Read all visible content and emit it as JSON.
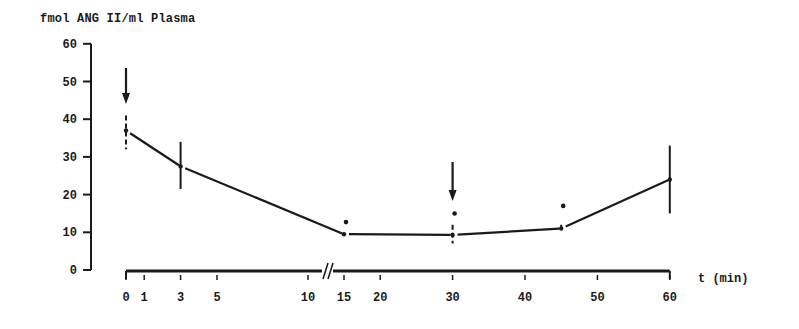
{
  "chart_data": {
    "type": "line",
    "title": "",
    "ylabel": "fmol ANG II/ml Plasma",
    "xlabel": "t (min)",
    "ylim": [
      0,
      60
    ],
    "yticks": [
      0,
      10,
      20,
      30,
      40,
      50,
      60
    ],
    "xticks": [
      0,
      1,
      3,
      5,
      10,
      15,
      20,
      30,
      40,
      50,
      60
    ],
    "xaxis_break": "between 10 and 15 min",
    "grid": false,
    "legend": null,
    "series": [
      {
        "name": "ANG II",
        "x": [
          0,
          3,
          15,
          30,
          45,
          60
        ],
        "values": [
          37,
          27.5,
          9.5,
          9.3,
          11,
          24
        ],
        "error_low": [
          32,
          21.5,
          9.5,
          7,
          10,
          15
        ],
        "error_high": [
          41,
          34,
          9.5,
          12,
          12,
          33
        ]
      }
    ],
    "annotations": [
      {
        "type": "arrow",
        "x": 0,
        "label": "down-arrow"
      },
      {
        "type": "arrow",
        "x": 30,
        "label": "down-arrow"
      },
      {
        "type": "significance-dot",
        "x": 15,
        "y": 12.7
      },
      {
        "type": "significance-dot",
        "x": 30,
        "y": 15
      },
      {
        "type": "significance-dot",
        "x": 45,
        "y": 17
      }
    ]
  },
  "labels": {
    "ylabel": "fmol ANG II/ml Plasma",
    "xlabel": "t (min)",
    "yticks": [
      "0",
      "10",
      "20",
      "30",
      "40",
      "50",
      "60"
    ],
    "xticks": [
      "0",
      "1",
      "3",
      "5",
      "10",
      "15",
      "20",
      "30",
      "40",
      "50",
      "60"
    ]
  }
}
